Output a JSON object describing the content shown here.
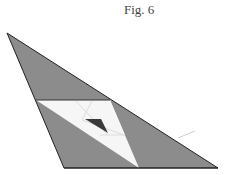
{
  "figure": {
    "title": "Fig. 6"
  },
  "colors": {
    "outer_fill": "#8c8c8c",
    "white_region": "#f6f6f6",
    "light_lines": "#e2e2e2",
    "inner_dark": "#3a3a3a",
    "edge": "#222222"
  }
}
